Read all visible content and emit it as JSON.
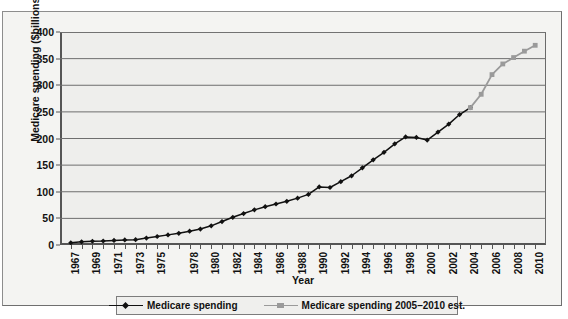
{
  "chart_data": {
    "type": "line",
    "title": "",
    "xlabel": "Year",
    "ylabel": "Medicare spending ($billions)",
    "xlim": [
      1966,
      2011
    ],
    "ylim": [
      0,
      400
    ],
    "ytick_step": 50,
    "yticks": [
      0,
      50,
      100,
      150,
      200,
      250,
      300,
      350,
      400
    ],
    "xticks": [
      1967,
      1968,
      1969,
      1970,
      1971,
      1972,
      1973,
      1974,
      1975,
      1976,
      1977,
      1978,
      1979,
      1980,
      1981,
      1982,
      1983,
      1984,
      1985,
      1986,
      1987,
      1988,
      1989,
      1990,
      1991,
      1992,
      1993,
      1994,
      1995,
      1996,
      1997,
      1998,
      1999,
      2000,
      2001,
      2002,
      2003,
      2004,
      2005,
      2006,
      2007,
      2008,
      2009,
      2010
    ],
    "xtick_labels": [
      "1967",
      "",
      "1969",
      "",
      "1971",
      "",
      "1973",
      "",
      "1975",
      "",
      "",
      "1978",
      "",
      "1980",
      "",
      "1982",
      "",
      "1984",
      "",
      "1986",
      "",
      "1988",
      "",
      "1990",
      "",
      "1992",
      "",
      "1994",
      "",
      "1996",
      "",
      "1998",
      "",
      "2000",
      "",
      "2002",
      "",
      "2004",
      "",
      "2006",
      "",
      "2008",
      "",
      "2010"
    ],
    "grid": "horizontal",
    "legend_position": "bottom",
    "series": [
      {
        "name": "Medicare spending",
        "color": "#111111",
        "marker": "diamond",
        "x": [
          1967,
          1968,
          1969,
          1970,
          1971,
          1972,
          1973,
          1974,
          1975,
          1976,
          1977,
          1978,
          1979,
          1980,
          1981,
          1982,
          1983,
          1984,
          1985,
          1986,
          1987,
          1988,
          1989,
          1990,
          1991,
          1992,
          1993,
          1994,
          1995,
          1996,
          1997,
          1998,
          1999,
          2000,
          2001,
          2002,
          2003,
          2004
        ],
        "values": [
          4.2,
          6.0,
          7.0,
          7.5,
          8.5,
          9.5,
          10.0,
          13.0,
          16.0,
          19.0,
          22.0,
          26.0,
          30.0,
          36.0,
          44.0,
          52.0,
          59.0,
          66.0,
          72.0,
          77.0,
          82.0,
          88.0,
          95.0,
          109.0,
          108.0,
          119.0,
          130.0,
          145.0,
          160.0,
          174.0,
          190.0,
          203.0,
          202.0,
          197.0,
          212.0,
          227.0,
          245.0,
          258.0
        ]
      },
      {
        "name": "Medicare spending 2005–2010 est.",
        "color": "#9a9a9a",
        "marker": "square",
        "x": [
          2004,
          2005,
          2006,
          2007,
          2008,
          2009,
          2010
        ],
        "values": [
          258.0,
          283.0,
          320.0,
          340.0,
          352.0,
          364.0,
          375.0
        ]
      }
    ]
  },
  "legend": {
    "items": [
      {
        "label": "Medicare spending",
        "color": "#111111"
      },
      {
        "label": "Medicare spending 2005–2010 est.",
        "color": "#9a9a9a"
      }
    ]
  },
  "axis": {
    "x_title": "Year",
    "y_title": "Medicare spending ($billions)"
  }
}
